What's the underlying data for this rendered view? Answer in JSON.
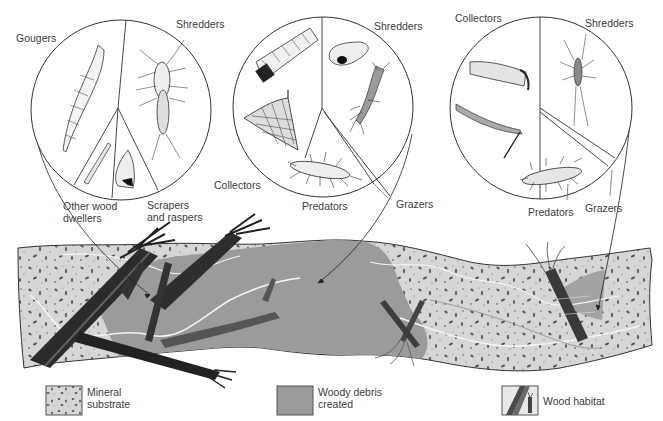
{
  "diagram": {
    "circles": [
      {
        "id": "circle-1",
        "center": [
          121,
          110
        ],
        "radius": 90,
        "labels": {
          "gougers": "Gougers",
          "shredders": "Shredders",
          "other_wood_dwellers": "Other wood\ndwellers",
          "scrapers_raspers": "Scrapers\nand raspers"
        }
      },
      {
        "id": "circle-2",
        "center": [
          323,
          107
        ],
        "radius": 90,
        "labels": {
          "shredders": "Shredders",
          "collectors": "Collectors",
          "predators": "Predators",
          "grazers": "Grazers"
        }
      },
      {
        "id": "circle-3",
        "center": [
          541,
          108
        ],
        "radius": 91,
        "labels": {
          "collectors": "Collectors",
          "shredders": "Shredders",
          "predators": "Predators",
          "grazers": "Grazers"
        }
      }
    ],
    "legend": [
      {
        "key": "mineral",
        "label": "Mineral\nsubstrate",
        "color": "#d4d4d4"
      },
      {
        "key": "woody",
        "label": "Woody debris\ncreated",
        "color": "#9a9a9a"
      },
      {
        "key": "wood",
        "label": "Wood habitat",
        "color": "#4a4a4a"
      }
    ],
    "colors": {
      "mineral_bg": "#d6d6d6",
      "mineral_speck": "#5a5a5a",
      "woody_area": "#9b9b9b",
      "wood_dark": "#2a2a2a",
      "outline": "#333333",
      "water_line": "#f2f2f2"
    }
  }
}
